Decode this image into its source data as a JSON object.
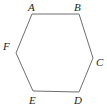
{
  "figure": {
    "type": "hexagon-diagram",
    "shape_name": "hexagon",
    "background_color": "#ffffff",
    "stroke_color": "#6e6e72",
    "stroke_width": 1,
    "fill": "none",
    "width": 107,
    "height": 111,
    "polygon_points": "32,14 79,14 93,58 79,92 33,91 16,53",
    "vertices": [
      {
        "id": "A",
        "label": "A",
        "x": 32,
        "y": 14
      },
      {
        "id": "B",
        "label": "B",
        "x": 79,
        "y": 14
      },
      {
        "id": "C",
        "label": "C",
        "x": 93,
        "y": 58
      },
      {
        "id": "D",
        "label": "D",
        "x": 79,
        "y": 92
      },
      {
        "id": "E",
        "label": "E",
        "x": 33,
        "y": 91
      },
      {
        "id": "F",
        "label": "F",
        "x": 16,
        "y": 53
      }
    ],
    "edges": [
      {
        "from": "A",
        "to": "B"
      },
      {
        "from": "B",
        "to": "C"
      },
      {
        "from": "C",
        "to": "D"
      },
      {
        "from": "D",
        "to": "E"
      },
      {
        "from": "E",
        "to": "F"
      },
      {
        "from": "F",
        "to": "A"
      }
    ]
  }
}
